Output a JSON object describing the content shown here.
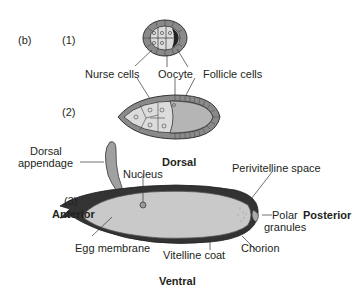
{
  "panel_label": "(b)",
  "stages": [
    {
      "label": "(1)"
    },
    {
      "label": "(2)"
    },
    {
      "label": "(3)"
    }
  ],
  "labels": {
    "nurse_cells": "Nurse cells",
    "oocyte": "Oocyte",
    "follicle_cells": "Follicle cells",
    "dorsal_appendage_line1": "Dorsal",
    "dorsal_appendage_line2": "appendage",
    "dorsal": "Dorsal",
    "nucleus": "Nucleus",
    "perivitelline_space": "Perivitelline space",
    "anterior": "Anterior",
    "posterior": "Posterior",
    "polar_granules_line1": "Polar",
    "polar_granules_line2": "granules",
    "egg_membrane": "Egg membrane",
    "chorion": "Chorion",
    "vitelline_coat": "Vitelline coat",
    "ventral": "Ventral"
  },
  "colors": {
    "follicle": "#8a8a8a",
    "nurse": "#d9d9d9",
    "oocyte": "#b5b5b5",
    "chorion": "#3a3a3a",
    "egg_interior": "#c9c9c9",
    "appendage": "#a0a0a0"
  }
}
